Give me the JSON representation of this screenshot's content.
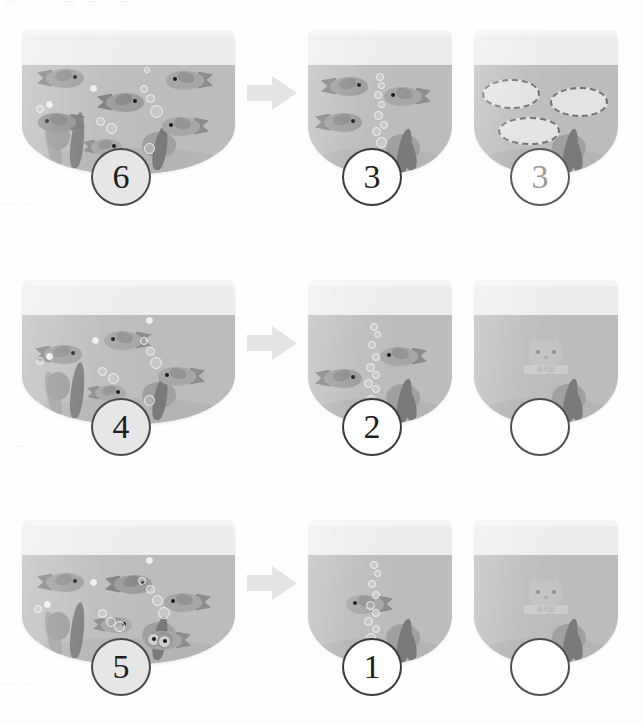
{
  "page": {
    "background_color": "#fefefe",
    "top_crop_artifact": "—  ·  ——  —",
    "page_ghost_marks": [
      "— —",
      "· — ·",
      "—  —"
    ]
  },
  "palette": {
    "tank_glass": "#ededed",
    "water": "#bcbcbc",
    "sand": "#b4b4b4",
    "fish_body": "#9b9b9b",
    "fish_fin": "#888888",
    "fish_tail": "#7f7f7f",
    "eye": "#1a1a1a",
    "bubble_outline": "#f2f2f2",
    "plant_dark": "#7a7a7a",
    "plant_light": "#a0a0a0",
    "arrow": "#e4e4e4",
    "badge_outline": "#3b3b3b",
    "badge_filled": "#e6e6e6",
    "badge_muted_text": "#9a9a9a",
    "ghost_outline": "#6f6f6f"
  },
  "arrow": {
    "icon": "arrow-right-icon",
    "label": "becomes"
  },
  "rows": [
    {
      "id": "row-1",
      "start": {
        "label": "6",
        "fish_count": 6,
        "badge_style": "filled",
        "bubble_count": 10,
        "plant_count": 5
      },
      "result": {
        "label": "3",
        "fish_count": 3,
        "badge_style": "outline",
        "bubble_count": 11,
        "plant_count": 4
      },
      "difference": {
        "label": "3",
        "ghost_fish_count": 3,
        "badge_style": "muted",
        "plant_count": 4
      }
    },
    {
      "id": "row-2",
      "start": {
        "label": "4",
        "fish_count": 4,
        "badge_style": "filled",
        "bubble_count": 10,
        "plant_count": 5
      },
      "result": {
        "label": "2",
        "fish_count": 2,
        "badge_style": "outline",
        "bubble_count": 12,
        "plant_count": 4
      },
      "difference": {
        "label": "",
        "ghost_fish_count": 0,
        "badge_style": "empty",
        "plant_count": 4,
        "watermark_caption": "새키트"
      }
    },
    {
      "id": "row-3",
      "start": {
        "label": "5",
        "fish_count": 5,
        "badge_style": "filled",
        "bubble_count": 11,
        "plant_count": 5
      },
      "result": {
        "label": "1",
        "fish_count": 1,
        "badge_style": "outline",
        "bubble_count": 12,
        "plant_count": 4
      },
      "difference": {
        "label": "",
        "ghost_fish_count": 0,
        "badge_style": "empty",
        "plant_count": 4,
        "watermark_caption": "새키트"
      }
    }
  ]
}
